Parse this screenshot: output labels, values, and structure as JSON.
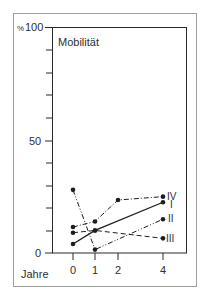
{
  "chart_data": {
    "type": "line",
    "title": "Mobilität",
    "xlabel": "Jahre",
    "ylabel": "%",
    "ylim": [
      0,
      100
    ],
    "yticks": [
      0,
      10,
      20,
      30,
      40,
      50,
      60,
      70,
      80,
      90,
      100
    ],
    "ytick_labels": {
      "0": "0",
      "50": "50",
      "100": "100"
    },
    "x": [
      0,
      1,
      2,
      4
    ],
    "xtick_labels": [
      "0",
      "1",
      "2",
      "4"
    ],
    "grid": false,
    "legend_position": "inline labels at right end of lines",
    "series": [
      {
        "name": "I",
        "style": "solid",
        "x": [
          0,
          1,
          4
        ],
        "values": [
          4,
          10,
          22.5
        ]
      },
      {
        "name": "II",
        "style": "dash-dot-dot",
        "x": [
          0,
          1,
          4
        ],
        "values": [
          28,
          1.5,
          15
        ]
      },
      {
        "name": "III",
        "style": "dashed",
        "x": [
          0,
          1,
          4
        ],
        "values": [
          9,
          10,
          6.5
        ]
      },
      {
        "name": "IV",
        "style": "dash-dot",
        "x": [
          0,
          1,
          2,
          4
        ],
        "values": [
          11.5,
          14,
          23.5,
          25
        ]
      }
    ]
  },
  "labels": {
    "title": "Mobilität",
    "xlabel": "Jahre",
    "y_unit": "%",
    "y100": "100",
    "y50": "50",
    "y0": "0",
    "x0": "0",
    "x1": "1",
    "x2": "2",
    "x4": "4",
    "series_I": "I",
    "series_II": "II",
    "series_III": "III",
    "series_IV": "IV"
  },
  "colors": {
    "line": "#1e1e1e",
    "frame": "#9a9a9a",
    "axis": "#2a2a2a"
  }
}
